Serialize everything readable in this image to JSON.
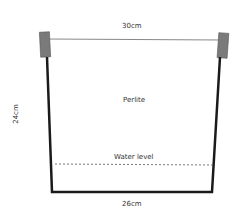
{
  "diagram": {
    "top_width_label": "30cm",
    "bottom_width_label": "26cm",
    "height_label": "24cm",
    "medium_label": "Perlite",
    "water_level_label": "Water level",
    "colors": {
      "wall": "#1a1a1a",
      "post": "#7a7a7a",
      "wire": "#888888",
      "water_line": "#555555"
    }
  }
}
